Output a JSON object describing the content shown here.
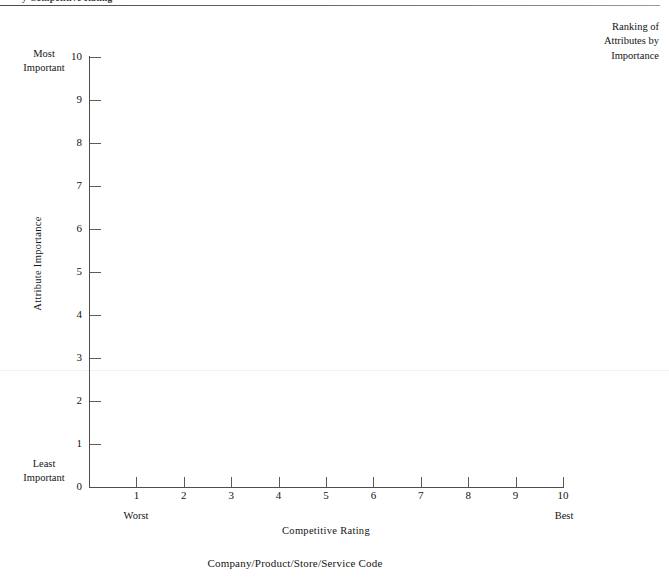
{
  "header": {
    "running_title": "y Competitive Rating",
    "rule": "horizontal-rule"
  },
  "corner_legend": {
    "line1": "Ranking of",
    "line2": "Attributes by",
    "line3": "Importance"
  },
  "y_axis": {
    "title": "Attribute  Importance",
    "top_label_line1": "Most",
    "top_label_line2": "Important",
    "bottom_label_line1": "Least",
    "bottom_label_line2": "Important"
  },
  "x_axis": {
    "title": "Competitive  Rating",
    "low_label": "Worst",
    "high_label": "Best"
  },
  "footer": {
    "caption": "Company/Product/Store/Service Code"
  },
  "chart_data": {
    "type": "scatter",
    "title": "",
    "xlabel": "Competitive  Rating",
    "ylabel": "Attribute  Importance",
    "xlim": [
      0,
      10
    ],
    "ylim": [
      0,
      10
    ],
    "x_ticks": [
      0,
      1,
      2,
      3,
      4,
      5,
      6,
      7,
      8,
      9,
      10
    ],
    "y_ticks": [
      0,
      1,
      2,
      3,
      4,
      5,
      6,
      7,
      8,
      9,
      10
    ],
    "x_tick_labels": [
      "0",
      "1",
      "2",
      "3",
      "4",
      "5",
      "6",
      "7",
      "8",
      "9",
      "10"
    ],
    "y_tick_labels": [
      "0",
      "1",
      "2",
      "3",
      "4",
      "5",
      "6",
      "7",
      "8",
      "9",
      "10"
    ],
    "grid": false,
    "legend": "none",
    "series": [
      {
        "name": "plotted attributes",
        "x": [],
        "y": []
      }
    ],
    "annotations": [
      {
        "text": "Most Important",
        "position": "y-axis-top"
      },
      {
        "text": "Least Important",
        "position": "y-axis-bottom"
      },
      {
        "text": "Worst",
        "position": "x-axis-left"
      },
      {
        "text": "Best",
        "position": "x-axis-right"
      },
      {
        "text": "Ranking of Attributes by Importance",
        "position": "top-right"
      }
    ]
  }
}
